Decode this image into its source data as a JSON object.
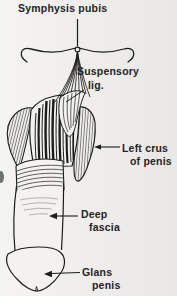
{
  "meta": {
    "background_color": "#f1f0ed",
    "ink_color": "#1c1c1c",
    "label_color": "#242424"
  },
  "labels": {
    "symphysis_pubis": "Symphysis pubis",
    "suspensory": "Suspensory",
    "suspensory_lig": "lig.",
    "left_crus": "Left crus",
    "left_crus_2": "of penis",
    "deep": "Deep",
    "deep_fascia": "fascia",
    "glans": "Glans",
    "glans_penis": "penis"
  }
}
